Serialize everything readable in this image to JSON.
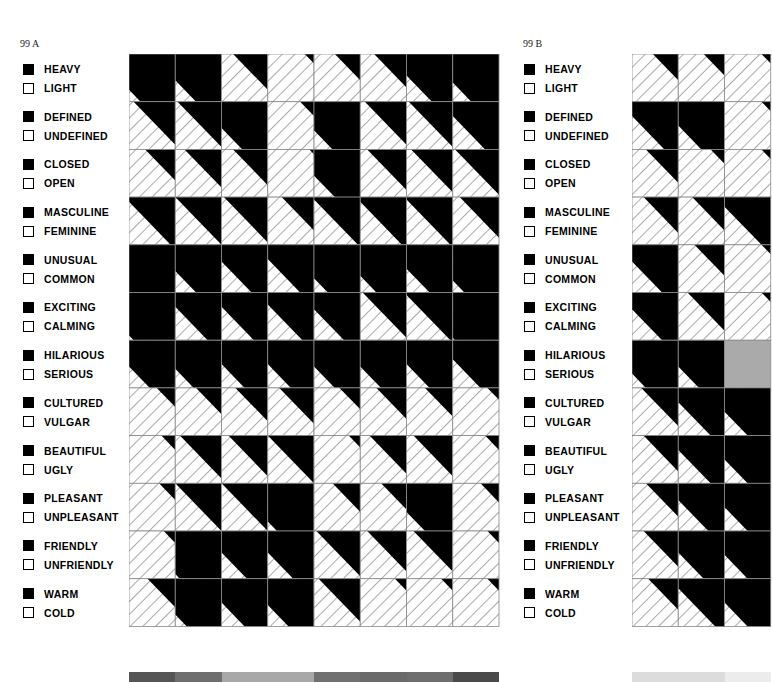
{
  "chart_data": [
    {
      "type": "heatmap",
      "title": "99 A",
      "encoding": "Each cell split by a diagonal boundary (parallel to top-left→bottom-right diagonal). Value d in [-1,1]: 1 = fully black (first term), -1 = fully hatched (second term), 0 = half.",
      "rows": [
        {
          "positive": "HEAVY",
          "negative": "LIGHT"
        },
        {
          "positive": "DEFINED",
          "negative": "UNDEFINED"
        },
        {
          "positive": "CLOSED",
          "negative": "OPEN"
        },
        {
          "positive": "MASCULINE",
          "negative": "FEMININE"
        },
        {
          "positive": "UNUSUAL",
          "negative": "COMMON"
        },
        {
          "positive": "EXCITING",
          "negative": "CALMING"
        },
        {
          "positive": "HILARIOUS",
          "negative": "SERIOUS"
        },
        {
          "positive": "CULTURED",
          "negative": "VULGAR"
        },
        {
          "positive": "BEAUTIFUL",
          "negative": "UGLY"
        },
        {
          "positive": "PLEASANT",
          "negative": "UNPLEASANT"
        },
        {
          "positive": "FRIENDLY",
          "negative": "UNFRIENDLY"
        },
        {
          "positive": "WARM",
          "negative": "COLD"
        }
      ],
      "columns": 8,
      "values": [
        [
          0.75,
          0.55,
          -0.25,
          -0.8,
          -0.45,
          -0.3,
          0.45,
          0.6
        ],
        [
          -0.1,
          -0.05,
          0.55,
          -0.7,
          0.6,
          -0.1,
          -0.05,
          0.3
        ],
        [
          -0.35,
          -0.2,
          -0.25,
          -0.9,
          0.55,
          -0.15,
          -0.1,
          -0.05
        ],
        [
          0.1,
          0.0,
          -0.05,
          -0.3,
          0.05,
          0.1,
          0.05,
          -0.15
        ],
        [
          1.0,
          0.55,
          0.35,
          0.3,
          0.7,
          0.65,
          0.5,
          0.75
        ],
        [
          0.9,
          0.3,
          0.3,
          0.25,
          0.35,
          -0.05,
          0.05,
          0.95
        ],
        [
          0.55,
          0.6,
          0.5,
          0.5,
          0.55,
          0.55,
          0.5,
          0.4
        ],
        [
          -0.6,
          -0.45,
          -0.3,
          -0.25,
          -0.55,
          -0.35,
          -0.4,
          -0.75
        ],
        [
          -0.7,
          -0.1,
          -0.15,
          0.0,
          -0.75,
          -0.2,
          -0.15,
          -0.7
        ],
        [
          -0.65,
          0.0,
          0.0,
          0.8,
          -0.4,
          -0.45,
          0.6,
          -0.6
        ],
        [
          -0.75,
          0.9,
          0.45,
          0.45,
          -0.05,
          -0.15,
          -0.15,
          -0.75
        ],
        [
          -0.4,
          0.75,
          0.5,
          0.55,
          -0.1,
          -0.75,
          -0.75,
          -0.75
        ]
      ],
      "swatches": [
        "#555555",
        "#6e6e6e",
        "#a8a8a8",
        "#a8a8a8",
        "#707070",
        "#6a6a6a",
        "#6e6e6e",
        "#4a4a4a"
      ]
    },
    {
      "type": "heatmap",
      "title": "99 B",
      "encoding": "Same as 99 A; only first ~3 columns visible (cropped).",
      "rows": [
        {
          "positive": "HEAVY",
          "negative": "LIGHT"
        },
        {
          "positive": "DEFINED",
          "negative": "UNDEFINED"
        },
        {
          "positive": "CLOSED",
          "negative": "OPEN"
        },
        {
          "positive": "MASCULINE",
          "negative": "FEMININE"
        },
        {
          "positive": "UNUSUAL",
          "negative": "COMMON"
        },
        {
          "positive": "EXCITING",
          "negative": "CALMING"
        },
        {
          "positive": "HILARIOUS",
          "negative": "SERIOUS"
        },
        {
          "positive": "CULTURED",
          "negative": "VULGAR"
        },
        {
          "positive": "BEAUTIFUL",
          "negative": "UGLY"
        },
        {
          "positive": "PLEASANT",
          "negative": "UNPLEASANT"
        },
        {
          "positive": "FRIENDLY",
          "negative": "UNFRIENDLY"
        },
        {
          "positive": "WARM",
          "negative": "COLD"
        }
      ],
      "columns_visible": 3,
      "values": [
        [
          -0.45,
          -0.55,
          -0.8
        ],
        [
          0.3,
          0.5,
          -0.8
        ],
        [
          -0.3,
          -0.7,
          -0.8
        ],
        [
          -0.25,
          -0.3,
          0.2
        ],
        [
          0.35,
          -0.35,
          -0.8
        ],
        [
          0.35,
          -0.2,
          -0.8
        ],
        [
          0.7,
          0.55,
          null
        ],
        [
          -0.2,
          0.3,
          0.5
        ],
        [
          -0.25,
          0.3,
          0.5
        ],
        [
          -0.3,
          0.35,
          0.5
        ],
        [
          -0.25,
          0.45,
          0.5
        ],
        [
          -0.35,
          0.2,
          0.5
        ]
      ],
      "swatches": [
        "#dcdcdc",
        "#dcdcdc",
        "#ececec"
      ]
    }
  ],
  "panels": {
    "a": {
      "id": "99 A"
    },
    "b": {
      "id": "99 B"
    }
  }
}
